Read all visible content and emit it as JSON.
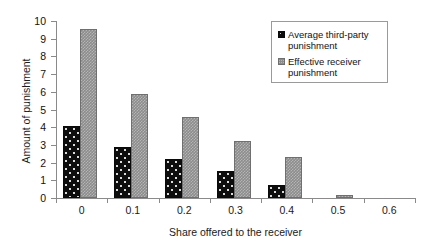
{
  "chart_data": {
    "type": "bar",
    "title": "",
    "xlabel": "Share offered to the receiver",
    "ylabel": "Amount of punishment",
    "categories": [
      "0",
      "0.1",
      "0.2",
      "0.3",
      "0.4",
      "0.5",
      "0.6"
    ],
    "series": [
      {
        "name": "Average third-party punishment",
        "values": [
          4.05,
          2.9,
          2.2,
          1.5,
          0.75,
          0,
          0
        ],
        "color": "#0d0d0d",
        "pattern": "black-with-white-dots"
      },
      {
        "name": "Effective receiver punishment",
        "values": [
          9.55,
          5.9,
          4.55,
          3.2,
          2.3,
          0.15,
          0
        ],
        "color": "#8c8c8c",
        "pattern": "gray-checkered"
      }
    ],
    "ylim": [
      0,
      10
    ],
    "yticks": [
      "0",
      "1",
      "2",
      "3",
      "4",
      "5",
      "6",
      "7",
      "8",
      "9",
      "10"
    ],
    "grid": false,
    "legend_position": "top-right"
  },
  "legend": {
    "entries": [
      {
        "label": "Average third-party punishment"
      },
      {
        "label": "Effective receiver punishment"
      }
    ]
  }
}
